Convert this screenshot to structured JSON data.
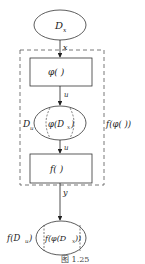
{
  "diagram": {
    "top_set": {
      "label": "D",
      "subscript": "x"
    },
    "edge_x": "x",
    "box_phi": {
      "label": "φ(   )"
    },
    "edge_u1": "u",
    "middle_set": {
      "outer_label": "D",
      "outer_subscript": "u",
      "inner_label": "φ(D",
      "inner_subscript": "x",
      "inner_close": ")"
    },
    "edge_u2": "u",
    "box_f": {
      "label": "f(   )"
    },
    "edge_y": "y",
    "composite_label": "f(φ(   ))",
    "bottom_set": {
      "outer_label": "f(D",
      "outer_subscript": "u",
      "outer_close": ")",
      "inner_label": "f(φ(D",
      "inner_subscript": "x",
      "inner_close": "))"
    },
    "caption": "图   1.25"
  },
  "colors": {
    "stroke": "#333333",
    "dashed": "#555555",
    "background": "#ffffff"
  }
}
